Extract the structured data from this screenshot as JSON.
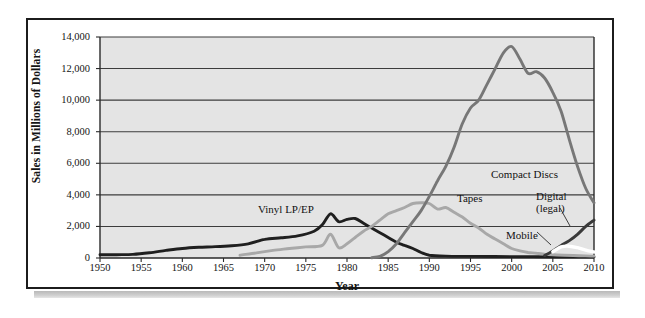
{
  "chart_data": {
    "type": "line",
    "title": "",
    "xlabel": "Year",
    "ylabel": "Sales in Millions of Dollars",
    "xlim": [
      1950,
      2010
    ],
    "ylim": [
      0,
      14000
    ],
    "grid": true,
    "legend_position": "inline-annotations",
    "x_ticks": [
      "1950",
      "1955",
      "1960",
      "1965",
      "1970",
      "1975",
      "1980",
      "1985",
      "1990",
      "1995",
      "2000",
      "2005",
      "2010"
    ],
    "y_ticks": [
      "0",
      "2,000",
      "4,000",
      "6,000",
      "8,000",
      "10,000",
      "12,000",
      "14,000"
    ],
    "series": [
      {
        "name": "Vinyl LP/EP",
        "color": "#1f1f1f",
        "label_text": "Vinyl LP/EP",
        "x": [
          1950,
          1952,
          1954,
          1956,
          1958,
          1960,
          1962,
          1964,
          1966,
          1968,
          1970,
          1972,
          1974,
          1976,
          1977,
          1978,
          1979,
          1980,
          1981,
          1982,
          1983,
          1984,
          1985,
          1986,
          1987,
          1988,
          1989,
          1990,
          1992,
          1995,
          2000,
          2005,
          2010
        ],
        "values": [
          200,
          210,
          230,
          330,
          480,
          600,
          680,
          720,
          780,
          900,
          1180,
          1280,
          1400,
          1700,
          2100,
          2800,
          2300,
          2450,
          2500,
          2200,
          1900,
          1600,
          1300,
          1000,
          800,
          600,
          350,
          180,
          120,
          100,
          90,
          80,
          70
        ]
      },
      {
        "name": "Tapes",
        "color": "#a8a8a8",
        "label_text": "Tapes",
        "x": [
          1967,
          1969,
          1971,
          1973,
          1975,
          1977,
          1978,
          1979,
          1980,
          1981,
          1982,
          1983,
          1984,
          1985,
          1986,
          1987,
          1988,
          1989,
          1990,
          1991,
          1992,
          1993,
          1994,
          1995,
          1996,
          1997,
          1998,
          1999,
          2000,
          2001,
          2002,
          2003,
          2004,
          2005,
          2010
        ],
        "values": [
          180,
          320,
          480,
          600,
          700,
          800,
          1500,
          650,
          900,
          1300,
          1700,
          2000,
          2400,
          2800,
          3000,
          3200,
          3450,
          3500,
          3450,
          3100,
          3200,
          2900,
          2600,
          2200,
          1900,
          1500,
          1200,
          900,
          600,
          450,
          350,
          300,
          250,
          200,
          120
        ]
      },
      {
        "name": "Compact Discs",
        "color": "#777777",
        "label_text": "Compact Discs",
        "x": [
          1983,
          1984,
          1985,
          1986,
          1987,
          1988,
          1989,
          1990,
          1991,
          1992,
          1993,
          1994,
          1995,
          1996,
          1997,
          1998,
          1999,
          2000,
          2001,
          2002,
          2003,
          2004,
          2005,
          2006,
          2007,
          2008,
          2009,
          2010
        ],
        "values": [
          20,
          100,
          400,
          900,
          1600,
          2300,
          3000,
          3900,
          4900,
          5800,
          7000,
          8500,
          9500,
          10000,
          11000,
          12000,
          13000,
          13400,
          12600,
          11700,
          11800,
          11400,
          10500,
          9300,
          7500,
          5800,
          4400,
          3500
        ]
      },
      {
        "name": "Digital (legal)",
        "color": "#3a3a3a",
        "label_text": "Digital\n(legal)",
        "x": [
          2004,
          2005,
          2006,
          2007,
          2008,
          2009,
          2010
        ],
        "values": [
          150,
          450,
          800,
          1100,
          1500,
          2000,
          2400
        ]
      },
      {
        "name": "Mobile",
        "color": "#ffffff",
        "label_text": "Mobile",
        "x": [
          2005,
          2006,
          2007,
          2008,
          2009,
          2010
        ],
        "values": [
          400,
          700,
          750,
          650,
          500,
          380
        ]
      }
    ],
    "annotations": [
      {
        "text": "Vinyl LP/EP",
        "x_px": 258,
        "y_px": 203
      },
      {
        "text": "Tapes",
        "x_px": 457,
        "y_px": 192
      },
      {
        "text": "Compact Discs",
        "x_px": 491,
        "y_px": 168
      },
      {
        "text": "Digital",
        "x_px": 536,
        "y_px": 190
      },
      {
        "text": "(legal)",
        "x_px": 536,
        "y_px": 202
      },
      {
        "text": "Mobile",
        "x_px": 506,
        "y_px": 229
      }
    ]
  },
  "figure": {
    "axis_title_x": "Year",
    "axis_title_y": "Sales in Millions of Dollars"
  }
}
